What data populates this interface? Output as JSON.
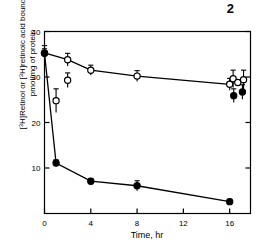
{
  "figure": {
    "number": "2"
  },
  "chart_data": {
    "type": "line",
    "title": "",
    "xlabel": "Time, hr",
    "ylabel_line1": "[3H]Retinol or [3H]retinoic acid bound,",
    "ylabel_line2": "pmol/mg of protein",
    "xlim": [
      0,
      17.8
    ],
    "ylim": [
      0,
      40
    ],
    "xticks": [
      0,
      4,
      8,
      12,
      16
    ],
    "xtick_labels": [
      "0",
      "4",
      "8",
      "12",
      "16"
    ],
    "yticks": [
      10,
      20,
      30,
      40
    ],
    "ytick_labels": [
      "10",
      "20",
      "30",
      "40"
    ],
    "grid": false,
    "legend": "none",
    "series": [
      {
        "name": "[3H]retinoic acid bound (open circles)",
        "marker": "open-circle",
        "x": [
          0,
          1,
          2,
          2,
          4,
          8,
          16
        ],
        "values": [
          35.3,
          24.8,
          33.8,
          29.3,
          31.5,
          30.2,
          28.4
        ],
        "errors": [
          1.6,
          2.6,
          1.4,
          1.6,
          1.1,
          1.2,
          1.3
        ],
        "connected": [
          0,
          2,
          4,
          5,
          6
        ]
      },
      {
        "name": "[3H]Retinol bound (filled circles)",
        "marker": "filled-circle",
        "x": [
          0,
          1,
          4,
          8,
          16
        ],
        "values": [
          35.2,
          11.1,
          7.1,
          6.1,
          2.6
        ],
        "errors": [
          1.0,
          0.7,
          0.6,
          1.1,
          0.5
        ],
        "connected": [
          0,
          1,
          2,
          3,
          4
        ]
      },
      {
        "name": "endpoint cluster open circles",
        "marker": "open-circle",
        "x": [
          16.3,
          16.7,
          17.2
        ],
        "values": [
          29.6,
          28.8,
          29.4
        ],
        "errors": [
          1.9,
          0.0,
          2.1
        ]
      },
      {
        "name": "endpoint cluster filled circles",
        "marker": "filled-circle",
        "x": [
          16.35,
          17.1
        ],
        "values": [
          25.9,
          26.7
        ],
        "errors": [
          1.5,
          1.6
        ]
      }
    ]
  }
}
